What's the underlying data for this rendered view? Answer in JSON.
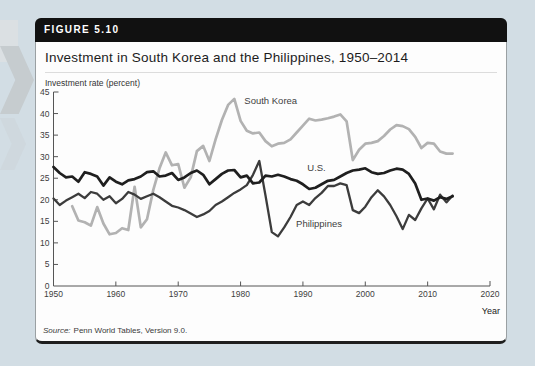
{
  "figure": {
    "label": "FIGURE 5.10",
    "title": "Investment in South Korea and the Philippines, 1950–2014",
    "source_prefix": "Source:",
    "source_text": "Penn World Tables, Version 9.0."
  },
  "chart_data": {
    "type": "line",
    "title": "Investment in South Korea and the Philippines, 1950–2014",
    "ylabel": "Investment rate (percent)",
    "xlabel": "Year",
    "xlim": [
      1950,
      2020
    ],
    "ylim": [
      0,
      45
    ],
    "x_ticks": [
      1950,
      1960,
      1970,
      1980,
      1990,
      2000,
      2010,
      2020
    ],
    "y_ticks": [
      0,
      5,
      10,
      15,
      20,
      25,
      30,
      35,
      40,
      45
    ],
    "grid": false,
    "legend": "inline annotations next to lines",
    "series": [
      {
        "name": "South Korea",
        "color": "#b2b2b2",
        "width": 2.7,
        "start_year": 1953,
        "values": [
          18.5,
          15.2,
          14.8,
          14.0,
          18.3,
          14.5,
          12.0,
          12.3,
          13.4,
          13.0,
          23.0,
          13.6,
          15.5,
          22.3,
          27.3,
          31.0,
          28.0,
          28.3,
          22.8,
          25.2,
          31.3,
          32.5,
          29.0,
          34.0,
          38.5,
          42.0,
          43.4,
          38.3,
          36.0,
          35.4,
          35.6,
          33.6,
          32.4,
          33.0,
          33.2,
          34.0,
          35.6,
          37.2,
          38.8,
          38.4,
          38.6,
          38.9,
          39.3,
          39.8,
          38.2,
          29.2,
          31.6,
          33.0,
          33.2,
          33.6,
          34.8,
          36.3,
          37.3,
          37.1,
          36.4,
          34.6,
          32.0,
          33.2,
          33.0,
          31.2,
          30.7,
          30.7
        ]
      },
      {
        "name": "Philippines",
        "color": "#3c3c3c",
        "width": 2.3,
        "start_year": 1950,
        "values": [
          20.3,
          18.8,
          19.8,
          20.6,
          21.4,
          20.4,
          21.8,
          21.4,
          20.0,
          20.8,
          19.2,
          20.2,
          21.8,
          21.2,
          20.2,
          20.8,
          21.4,
          20.6,
          19.6,
          18.6,
          18.2,
          17.6,
          16.8,
          16.0,
          16.6,
          17.4,
          18.8,
          19.6,
          20.6,
          21.6,
          22.4,
          23.4,
          25.8,
          29.0,
          21.0,
          12.5,
          11.5,
          13.6,
          16.0,
          18.8,
          19.6,
          18.8,
          20.4,
          21.6,
          23.2,
          23.2,
          23.8,
          23.4,
          17.6,
          16.9,
          18.4,
          20.6,
          22.2,
          20.8,
          18.8,
          16.2,
          13.2,
          16.5,
          15.3,
          18.0,
          20.3,
          17.8,
          21.2,
          19.4,
          21.0
        ]
      },
      {
        "name": "U.S.",
        "color": "#1f1f1f",
        "width": 2.7,
        "start_year": 1950,
        "values": [
          27.6,
          26.2,
          25.2,
          25.4,
          24.2,
          26.4,
          26.0,
          25.4,
          23.3,
          25.2,
          24.2,
          23.6,
          24.5,
          24.8,
          25.4,
          26.4,
          26.6,
          25.4,
          25.6,
          26.2,
          24.6,
          25.2,
          26.2,
          26.8,
          25.8,
          23.6,
          24.8,
          26.0,
          26.8,
          26.9,
          25.2,
          25.6,
          23.8,
          24.0,
          25.6,
          25.4,
          25.8,
          25.4,
          24.8,
          24.4,
          23.6,
          22.5,
          22.8,
          23.6,
          24.4,
          24.6,
          25.4,
          26.2,
          26.8,
          27.0,
          27.3,
          26.4,
          26.0,
          26.2,
          26.8,
          27.2,
          27.0,
          26.0,
          23.8,
          20.0,
          20.3,
          19.8,
          20.6,
          20.2,
          20.8
        ]
      }
    ],
    "annotations": [
      {
        "text": "South Korea",
        "x": 1980.6,
        "y": 42.8
      },
      {
        "text": "U.S.",
        "x": 1990.7,
        "y": 27.3
      },
      {
        "text": "Philippines",
        "x": 1988.9,
        "y": 14.3
      }
    ]
  }
}
